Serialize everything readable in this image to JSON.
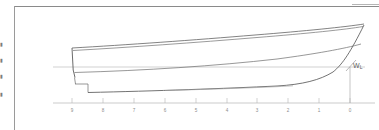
{
  "figure": {
    "kind": "hull-profile-sheer-plan",
    "background_color": "#ffffff",
    "line_color": "#5a5a5a",
    "light_line_color": "#9e9e9e",
    "axis_color": "#b0b0b0",
    "text_color": "#8c8c8c"
  },
  "page_marginalia": {
    "fragments": [
      "▮",
      "▮",
      "▮",
      "▮"
    ]
  },
  "waterline": {
    "label_main": "W",
    "label_sub": "L",
    "label_full": "WL"
  },
  "chart_data": {
    "type": "line",
    "title": "",
    "subtitle": "",
    "xlabel": "",
    "ylabel": "",
    "grid": false,
    "legend": null,
    "axis": {
      "x_range": [
        0,
        9
      ],
      "x_direction": "right-to-left",
      "tick_count": 10
    },
    "categories": [
      "9",
      "8",
      "7",
      "6",
      "5",
      "4",
      "3",
      "2",
      "1",
      "0"
    ],
    "station_ticks": [
      {
        "label": "9",
        "x_px": 57
      },
      {
        "label": "8",
        "x_px": 88
      },
      {
        "label": "7",
        "x_px": 119
      },
      {
        "label": "6",
        "x_px": 150
      },
      {
        "label": "5",
        "x_px": 181
      },
      {
        "label": "4",
        "x_px": 212
      },
      {
        "label": "3",
        "x_px": 242
      },
      {
        "label": "2",
        "x_px": 273
      },
      {
        "label": "1",
        "x_px": 304
      },
      {
        "label": "0",
        "x_px": 335
      }
    ],
    "series": [
      {
        "name": "sheer-line-outer",
        "points": [
          [
            57,
            41
          ],
          [
            100,
            38
          ],
          [
            160,
            34
          ],
          [
            220,
            29
          ],
          [
            280,
            24
          ],
          [
            330,
            20
          ],
          [
            348,
            18
          ]
        ]
      },
      {
        "name": "sheer-line-inner",
        "points": [
          [
            58,
            43
          ],
          [
            100,
            40
          ],
          [
            160,
            36
          ],
          [
            220,
            31
          ],
          [
            280,
            26
          ],
          [
            330,
            22
          ],
          [
            347,
            20
          ]
        ]
      },
      {
        "name": "waterline-datum",
        "points": [
          [
            38,
            60
          ],
          [
            350,
            60
          ]
        ]
      },
      {
        "name": "deck-edge-line",
        "points": [
          [
            60,
            65
          ],
          [
            140,
            62
          ],
          [
            220,
            57
          ],
          [
            290,
            50
          ],
          [
            330,
            44
          ],
          [
            345,
            40
          ]
        ]
      },
      {
        "name": "keel-bottom-profile",
        "points": [
          [
            73,
            85
          ],
          [
            140,
            83
          ],
          [
            210,
            81
          ],
          [
            260,
            79
          ],
          [
            290,
            77
          ],
          [
            310,
            71
          ],
          [
            325,
            62
          ],
          [
            334,
            50
          ],
          [
            341,
            38
          ],
          [
            347,
            24
          ]
        ]
      },
      {
        "name": "stem-post",
        "points": [
          [
            57,
            41
          ],
          [
            58,
            62
          ],
          [
            60,
            70
          ]
        ]
      },
      {
        "name": "skeg-step",
        "points": [
          [
            60,
            70
          ],
          [
            60,
            77
          ],
          [
            73,
            77
          ],
          [
            73,
            85
          ]
        ]
      },
      {
        "name": "station-0-dropline",
        "points": [
          [
            335,
            60
          ],
          [
            335,
            96
          ]
        ]
      },
      {
        "name": "baseline",
        "points": [
          [
            38,
            96
          ],
          [
            360,
            96
          ]
        ]
      }
    ]
  }
}
